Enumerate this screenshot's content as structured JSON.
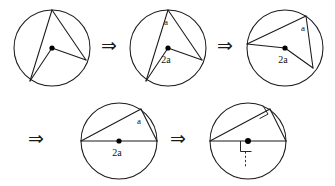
{
  "figure": {
    "background_color": "#ffffff",
    "ink_color": "#1a1a1a",
    "arrow_symbol": "⇒",
    "labels": {
      "inscribed_angle": "a",
      "central_angle": "2a"
    }
  },
  "steps": [
    {
      "id": "step-1",
      "name": "circle-generic-inscribed-angle",
      "caption": "",
      "center_label": "",
      "apex_label": "",
      "has_right_angle": false,
      "has_diameter": false
    },
    {
      "id": "step-2",
      "name": "circle-labeled-a-and-2a",
      "caption": "",
      "center_label": "2a",
      "apex_label": "a",
      "has_right_angle": false,
      "has_diameter": false
    },
    {
      "id": "step-3",
      "name": "circle-rotated-chord-pair",
      "caption": "",
      "center_label": "2a",
      "apex_label": "a",
      "has_right_angle": false,
      "has_diameter": false
    },
    {
      "id": "step-4",
      "name": "circle-diameter-case",
      "caption": "",
      "center_label": "2a",
      "apex_label": "a",
      "has_right_angle": false,
      "has_diameter": true
    },
    {
      "id": "step-5",
      "name": "circle-right-angle-thales",
      "caption": "",
      "center_label": "",
      "apex_label": "",
      "has_right_angle": true,
      "has_diameter": true
    }
  ],
  "arrows": [
    {
      "id": "arrow-1",
      "name": "arrow-step1-to-step2",
      "symbol": "⇒"
    },
    {
      "id": "arrow-2",
      "name": "arrow-step2-to-step3",
      "symbol": "⇒"
    },
    {
      "id": "arrow-3",
      "name": "arrow-row-break",
      "symbol": "⇒"
    },
    {
      "id": "arrow-4",
      "name": "arrow-step4-to-step5",
      "symbol": "⇒"
    }
  ]
}
